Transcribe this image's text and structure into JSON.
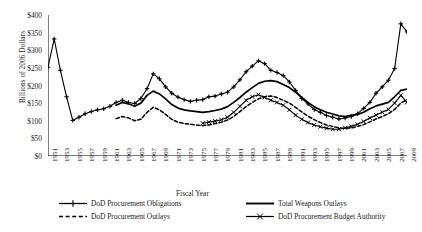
{
  "chart_data": {
    "type": "line",
    "title": "",
    "xlabel": "Fiscal Year",
    "ylabel": "Billions of 2006 Dollars",
    "xlim": [
      1951,
      2009
    ],
    "ylim": [
      0,
      400
    ],
    "ytick_labels": [
      "$0",
      "$50",
      "$100",
      "$150",
      "$200",
      "$250",
      "$300",
      "$350",
      "$400"
    ],
    "ytick_values": [
      0,
      50,
      100,
      150,
      200,
      250,
      300,
      350,
      400
    ],
    "xtick_labels": [
      "1951",
      "1953",
      "1955",
      "1957",
      "1959",
      "1961",
      "1963",
      "1965",
      "1967",
      "1969",
      "1971",
      "1973",
      "1975",
      "1977",
      "1979",
      "1981",
      "1983",
      "1985",
      "1987",
      "1989",
      "1991",
      "1993",
      "1995",
      "1997",
      "1999",
      "2001",
      "2003",
      "2005",
      "2007",
      "2009"
    ],
    "xtick_values": [
      1951,
      1953,
      1955,
      1957,
      1959,
      1961,
      1963,
      1965,
      1967,
      1969,
      1971,
      1973,
      1975,
      1977,
      1979,
      1981,
      1983,
      1985,
      1987,
      1989,
      1991,
      1993,
      1995,
      1997,
      1999,
      2001,
      2003,
      2005,
      2007,
      2009
    ],
    "grid": false,
    "legend_position": "below",
    "series": [
      {
        "name": "DoD Procurement Obligations",
        "style": "solid-plus",
        "color": "#000000",
        "x": [
          1951,
          1952,
          1953,
          1954,
          1955,
          1956,
          1957,
          1958,
          1959,
          1960,
          1961,
          1962,
          1963,
          1964,
          1965,
          1966,
          1967,
          1968,
          1969,
          1970,
          1971,
          1972,
          1973,
          1974,
          1975,
          1976,
          1977,
          1978,
          1979,
          1980,
          1981,
          1982,
          1983,
          1984,
          1985,
          1986,
          1987,
          1988,
          1989,
          1990,
          1991,
          1992,
          1993,
          1994,
          1995,
          1996,
          1997,
          1998,
          1999,
          2000,
          2001,
          2002,
          2003,
          2004,
          2005,
          2006,
          2007,
          2008,
          2009
        ],
        "y": [
          252,
          332,
          243,
          168,
          101,
          110,
          120,
          126,
          131,
          134,
          141,
          152,
          158,
          152,
          149,
          163,
          191,
          233,
          219,
          196,
          178,
          167,
          160,
          155,
          158,
          160,
          168,
          170,
          176,
          181,
          196,
          216,
          239,
          255,
          270,
          262,
          243,
          237,
          228,
          210,
          186,
          163,
          148,
          132,
          124,
          115,
          110,
          105,
          108,
          112,
          120,
          135,
          152,
          178,
          196,
          215,
          248,
          375,
          352
        ]
      },
      {
        "name": "Total Weapons Outlays",
        "style": "solid-thick",
        "color": "#000000",
        "x": [
          1962,
          1963,
          1964,
          1965,
          1966,
          1967,
          1968,
          1969,
          1970,
          1971,
          1972,
          1973,
          1974,
          1975,
          1976,
          1977,
          1978,
          1979,
          1980,
          1981,
          1982,
          1983,
          1984,
          1985,
          1986,
          1987,
          1988,
          1989,
          1990,
          1991,
          1992,
          1993,
          1994,
          1995,
          1996,
          1997,
          1998,
          1999,
          2000,
          2001,
          2002,
          2003,
          2004,
          2005,
          2006,
          2007,
          2008,
          2009
        ],
        "y": [
          144,
          152,
          148,
          141,
          150,
          172,
          184,
          176,
          162,
          146,
          136,
          131,
          128,
          126,
          124,
          126,
          129,
          133,
          140,
          152,
          166,
          181,
          194,
          206,
          212,
          214,
          211,
          203,
          194,
          181,
          166,
          152,
          140,
          131,
          124,
          119,
          114,
          112,
          115,
          118,
          124,
          134,
          142,
          147,
          152,
          168,
          186,
          190
        ]
      },
      {
        "name": "DoD Procurement Outlays",
        "style": "dashed",
        "color": "#000000",
        "x": [
          1962,
          1963,
          1964,
          1965,
          1966,
          1967,
          1968,
          1969,
          1970,
          1971,
          1972,
          1973,
          1974,
          1975,
          1976,
          1977,
          1978,
          1979,
          1980,
          1981,
          1982,
          1983,
          1984,
          1985,
          1986,
          1987,
          1988,
          1989,
          1990,
          1991,
          1992,
          1993,
          1994,
          1995,
          1996,
          1997,
          1998,
          1999,
          2000,
          2001,
          2002,
          2003,
          2004,
          2005,
          2006,
          2007,
          2008,
          2009
        ],
        "y": [
          106,
          112,
          108,
          100,
          104,
          124,
          138,
          131,
          118,
          104,
          96,
          92,
          90,
          88,
          86,
          88,
          92,
          96,
          102,
          112,
          126,
          140,
          152,
          162,
          168,
          170,
          166,
          158,
          150,
          138,
          125,
          113,
          103,
          95,
          88,
          84,
          80,
          78,
          80,
          84,
          89,
          97,
          105,
          112,
          120,
          132,
          150,
          160
        ]
      },
      {
        "name": "DoD Procurement Budget Authority",
        "style": "solid-x",
        "color": "#000000",
        "x": [
          1976,
          1977,
          1978,
          1979,
          1980,
          1981,
          1982,
          1983,
          1984,
          1985,
          1986,
          1987,
          1988,
          1989,
          1990,
          1991,
          1992,
          1993,
          1994,
          1995,
          1996,
          1997,
          1998,
          1999,
          2000,
          2001,
          2002,
          2003,
          2004,
          2005,
          2006,
          2007,
          2008,
          2009
        ],
        "y": [
          93,
          96,
          99,
          103,
          110,
          124,
          141,
          158,
          168,
          174,
          166,
          158,
          152,
          144,
          131,
          116,
          104,
          95,
          88,
          83,
          79,
          76,
          76,
          80,
          84,
          90,
          98,
          108,
          116,
          124,
          132,
          150,
          172,
          152
        ]
      }
    ]
  },
  "axis": {
    "ylabel": "Billions of 2006 Dollars",
    "xlabel": "Fiscal Year"
  },
  "legend": {
    "left": [
      {
        "label": "DoD Procurement Obligations",
        "key": "solid-plus"
      },
      {
        "label": "DoD Procurement Outlays",
        "key": "dashed"
      }
    ],
    "right": [
      {
        "label": "Total Weapons Outlays",
        "key": "solid-thick"
      },
      {
        "label": "DoD Procurement Budget Authority",
        "key": "solid-x"
      }
    ]
  }
}
